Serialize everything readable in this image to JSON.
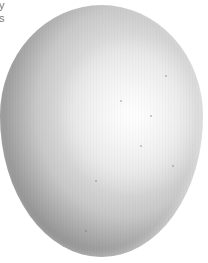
{
  "image": {
    "subject": "egg",
    "description": "Photograph of a white egg on a white background, lit from the right",
    "text_fragments": [
      "y",
      "s"
    ],
    "colors": {
      "background": "#ffffff",
      "highlight": "#f2f2f2",
      "midtone": "#c8c8c8",
      "shadow": "#4c4c4c",
      "text": "#7a7a7a"
    }
  }
}
